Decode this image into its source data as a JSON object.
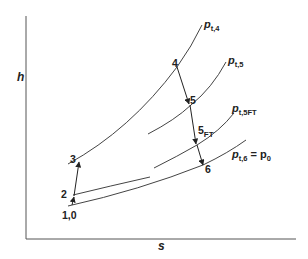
{
  "diagram": {
    "type": "h-s diagram (turbofan / gas turbine cycle)",
    "axes": {
      "y_label": "h",
      "x_label": "s"
    },
    "isobars": [
      {
        "id": "pt4",
        "label_main": "p",
        "label_sub": "t,4"
      },
      {
        "id": "pt5",
        "label_main": "p",
        "label_sub": "t,5"
      },
      {
        "id": "pt5ft",
        "label_main": "p",
        "label_sub": "t,5FT"
      },
      {
        "id": "pt6",
        "label_main": "p",
        "label_sub": "t,6",
        "label_eq": " = p",
        "label_eq_sub": "0"
      }
    ],
    "states": [
      {
        "id": "s10",
        "label": "1,0"
      },
      {
        "id": "s2",
        "label": "2"
      },
      {
        "id": "s3",
        "label": "3"
      },
      {
        "id": "s4",
        "label": "4"
      },
      {
        "id": "s5",
        "label": "5"
      },
      {
        "id": "s5ft",
        "label_main": "5",
        "label_sub": "FT"
      },
      {
        "id": "s6",
        "label": "6"
      }
    ],
    "processes": [
      {
        "from": "1,0",
        "to": "2"
      },
      {
        "from": "2",
        "to": "3"
      },
      {
        "from": "4",
        "to": "5"
      },
      {
        "from": "5",
        "to": "5FT"
      },
      {
        "from": "5FT",
        "to": "6"
      }
    ],
    "colors": {
      "line": "#333333",
      "text": "#222222",
      "background": "#ffffff"
    }
  }
}
